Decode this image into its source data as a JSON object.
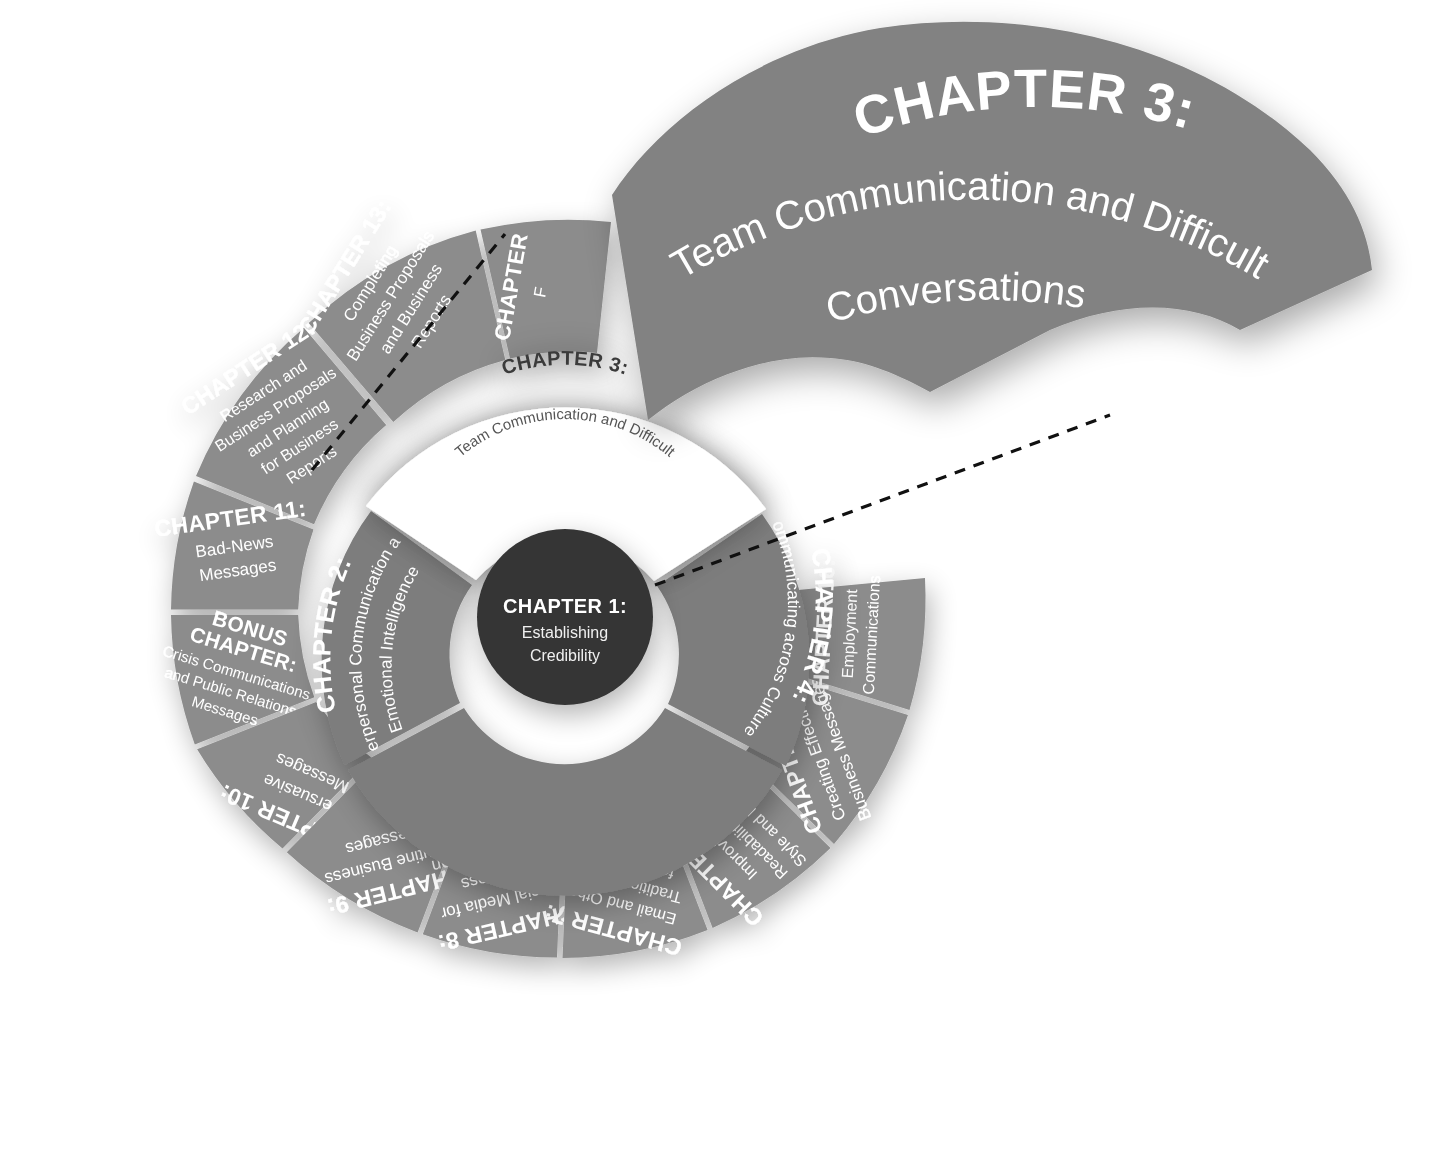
{
  "figure": {
    "type": "radial-chapter-wheel",
    "background_color": "#ffffff",
    "colors": {
      "hub": "#343434",
      "inner_ring": "#7d7d7d",
      "outer_ring": "#8c8c8c",
      "highlight_wedge": "#ffffff",
      "callout_wedge": "#828282",
      "leader_line": "#111111",
      "text_on_gray": "#ffffff",
      "text_on_white": "#3a3a3a"
    }
  },
  "hub": {
    "title": "CHAPTER 1:",
    "subtitle_lines": [
      "Establishing",
      "Credibility"
    ]
  },
  "highlighted_chapter": {
    "title": "CHAPTER 3:",
    "subtitle_lines": [
      "Team Communication and Difficult",
      "Conversations"
    ]
  },
  "callout": {
    "title": "CHAPTER 3:",
    "subtitle_line_1": "Team Communication and Difficult",
    "subtitle_line_2": "Conversations"
  },
  "inner_ring": {
    "segments": [
      {
        "id": "chapter-2",
        "title": "CHAPTER 2:",
        "subtitle_lines": [
          "Interpersonal Communication and",
          "Emotional Intelligence"
        ],
        "highlighted": false
      },
      {
        "id": "chapter-3",
        "title": "CHAPTER 3:",
        "subtitle_lines": [
          "Team Communication and Difficult",
          "Conversations"
        ],
        "highlighted": true
      },
      {
        "id": "chapter-4",
        "title": "CHAPTER 4:",
        "subtitle_lines": [
          "Communicating across Cultures"
        ],
        "highlighted": false
      }
    ]
  },
  "outer_ring": {
    "segments": [
      {
        "id": "chapter-14",
        "title": "CHAPTER",
        "subtitle_lines": [
          "F"
        ],
        "obscured": true
      },
      {
        "id": "chapter-16",
        "title": "CHAPTER 16:",
        "subtitle_lines": [
          "Employment",
          "Communications"
        ],
        "obscured": true
      },
      {
        "id": "chapter-5",
        "title": "CHAPTER 5:",
        "subtitle_lines": [
          "Creating Effective",
          "Business Messages"
        ],
        "obscured": false
      },
      {
        "id": "chapter-6",
        "title": "CHAPTER 6:",
        "subtitle_lines": [
          "Improving",
          "Readability with",
          "Style and Design"
        ],
        "obscured": false
      },
      {
        "id": "chapter-7",
        "title": "CHAPTER 7:",
        "subtitle_lines": [
          "Email and Other",
          "Traditional Tools",
          "for Business",
          "Communication"
        ],
        "obscured": false
      },
      {
        "id": "chapter-8",
        "title": "CHAPTER 8:",
        "subtitle_lines": [
          "Social Media for",
          "Business",
          "Communication"
        ],
        "obscured": false
      },
      {
        "id": "chapter-9",
        "title": "CHAPTER 9:",
        "subtitle_lines": [
          "Routine Business",
          "Messages"
        ],
        "obscured": false
      },
      {
        "id": "chapter-10",
        "title": "CHAPTER 10:",
        "subtitle_lines": [
          "Persuasive",
          "Messages"
        ],
        "obscured": false
      },
      {
        "id": "bonus-chapter",
        "title": "BONUS CHAPTER:",
        "subtitle_lines": [
          "Crisis Communications",
          "and Public Relations",
          "Messages"
        ],
        "obscured": false
      },
      {
        "id": "chapter-11",
        "title": "CHAPTER 11:",
        "subtitle_lines": [
          "Bad-News",
          "Messages"
        ],
        "obscured": false
      },
      {
        "id": "chapter-12",
        "title": "CHAPTER 12:",
        "subtitle_lines": [
          "Research and",
          "Business Proposals",
          "and Planning",
          "for Business",
          "Reports"
        ],
        "obscured": false
      },
      {
        "id": "chapter-13",
        "title": "CHAPTER 13:",
        "subtitle_lines": [
          "Completing",
          "Business Proposals",
          "and Business",
          "Reports"
        ],
        "obscured": false
      }
    ]
  },
  "labels": {
    "bonus_line_1": "BONUS",
    "bonus_line_2": "CHAPTER:"
  }
}
